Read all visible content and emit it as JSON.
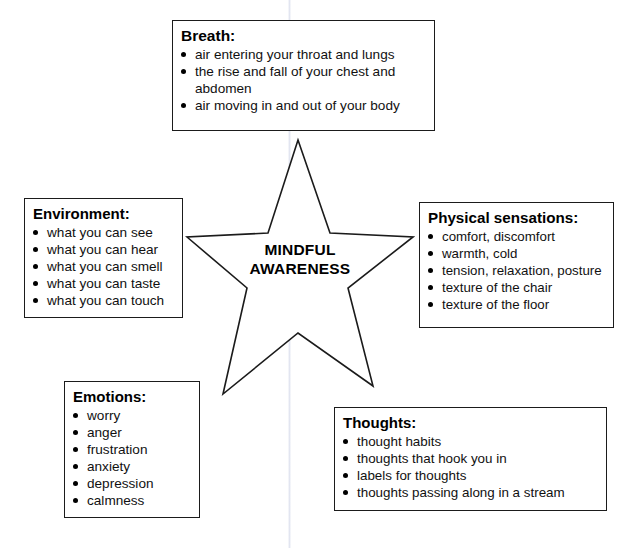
{
  "diagram": {
    "center": {
      "shape": "five-pointed-star",
      "label_line_1": "MINDFUL",
      "label_line_2": "AWARENESS"
    },
    "panels": [
      {
        "id": "breath",
        "title": "Breath:",
        "items": [
          "air entering your throat and lungs",
          "the rise and fall of your chest and abdomen",
          "air moving in and out of your body"
        ]
      },
      {
        "id": "environment",
        "title": "Environment:",
        "items": [
          "what you can see",
          "what you can hear",
          "what you can smell",
          "what you can taste",
          "what you can touch"
        ]
      },
      {
        "id": "physical",
        "title": "Physical sensations:",
        "items": [
          "comfort, discomfort",
          "warmth, cold",
          "tension, relaxation, posture",
          "texture of the chair",
          "texture of the floor"
        ]
      },
      {
        "id": "emotions",
        "title": "Emotions:",
        "items": [
          "worry",
          "anger",
          "frustration",
          "anxiety",
          "depression",
          "calmness"
        ]
      },
      {
        "id": "thoughts",
        "title": "Thoughts:",
        "items": [
          "thought habits",
          "thoughts that hook you in",
          "labels for thoughts",
          "thoughts passing along in a stream"
        ]
      }
    ],
    "colors": {
      "stroke": "#1b1b1b",
      "text": "#000000",
      "background": "#ffffff"
    }
  }
}
